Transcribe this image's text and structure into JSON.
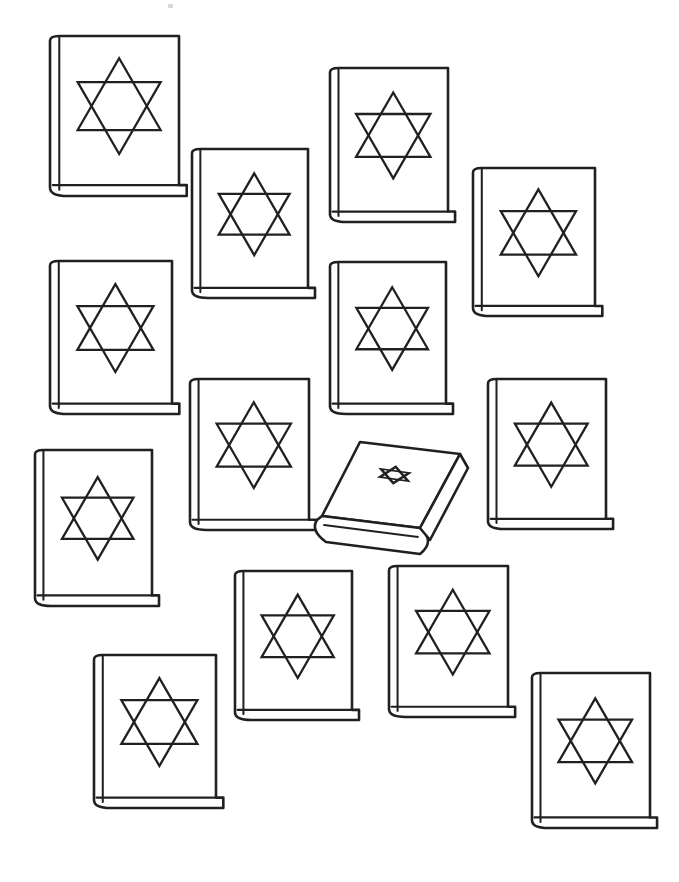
{
  "page": {
    "width": 679,
    "height": 882,
    "background_color": "#ffffff",
    "line_color": "#231f20",
    "fill_color": "#ffffff",
    "stroke_width": 2.6,
    "style": "line-art coloring page, black outline on white",
    "total_books": 14,
    "upright_books": 13,
    "tilted_books": 1,
    "faint_artifact": {
      "name": "scan-speck",
      "x": 168,
      "y": 4,
      "width": 5,
      "height": 4,
      "color": "#d8d8d8"
    }
  },
  "books": [
    {
      "id": "book-1",
      "name": "book-top-left",
      "x": 50,
      "y": 36,
      "w": 129,
      "h": 160,
      "star_scale": 1.0,
      "pose": "upright"
    },
    {
      "id": "book-2",
      "name": "book-top-left-inner",
      "x": 192,
      "y": 149,
      "w": 116,
      "h": 149,
      "star_scale": 0.95,
      "pose": "upright"
    },
    {
      "id": "book-3",
      "name": "book-top-center",
      "x": 330,
      "y": 68,
      "w": 118,
      "h": 154,
      "star_scale": 0.98,
      "pose": "upright"
    },
    {
      "id": "book-4",
      "name": "book-top-right",
      "x": 473,
      "y": 168,
      "w": 122,
      "h": 148,
      "star_scale": 0.96,
      "pose": "upright"
    },
    {
      "id": "book-5",
      "name": "book-middle-left",
      "x": 50,
      "y": 261,
      "w": 122,
      "h": 153,
      "star_scale": 0.97,
      "pose": "upright"
    },
    {
      "id": "book-6",
      "name": "book-middle-center",
      "x": 330,
      "y": 262,
      "w": 116,
      "h": 152,
      "star_scale": 0.96,
      "pose": "upright"
    },
    {
      "id": "book-7",
      "name": "book-middle-inner-left",
      "x": 190,
      "y": 379,
      "w": 119,
      "h": 151,
      "star_scale": 0.97,
      "pose": "upright"
    },
    {
      "id": "book-8",
      "name": "book-middle-right",
      "x": 488,
      "y": 379,
      "w": 118,
      "h": 150,
      "star_scale": 0.96,
      "pose": "upright"
    },
    {
      "id": "book-9",
      "name": "book-lower-left",
      "x": 35,
      "y": 450,
      "w": 117,
      "h": 156,
      "star_scale": 0.95,
      "pose": "upright"
    },
    {
      "id": "book-10",
      "name": "book-bottom-center-left",
      "x": 235,
      "y": 571,
      "w": 117,
      "h": 149,
      "star_scale": 0.96,
      "pose": "upright"
    },
    {
      "id": "book-11",
      "name": "book-bottom-center-right",
      "x": 389,
      "y": 566,
      "w": 119,
      "h": 151,
      "star_scale": 0.96,
      "pose": "upright"
    },
    {
      "id": "book-12",
      "name": "book-bottom-left",
      "x": 94,
      "y": 655,
      "w": 122,
      "h": 153,
      "star_scale": 0.97,
      "pose": "upright"
    },
    {
      "id": "book-13",
      "name": "book-bottom-right",
      "x": 532,
      "y": 673,
      "w": 118,
      "h": 155,
      "star_scale": 0.97,
      "pose": "upright"
    },
    {
      "id": "book-14",
      "name": "book-tilted-center",
      "x": 312,
      "y": 440,
      "w": 160,
      "h": 115,
      "star_scale": 0.55,
      "pose": "tilted"
    }
  ],
  "star_of_david": {
    "name": "star-of-david-icon",
    "shape": "hexagram",
    "description": "two overlapping equilateral triangles forming a six-pointed star outline",
    "points": 6,
    "filled": false
  },
  "chart_data": null
}
